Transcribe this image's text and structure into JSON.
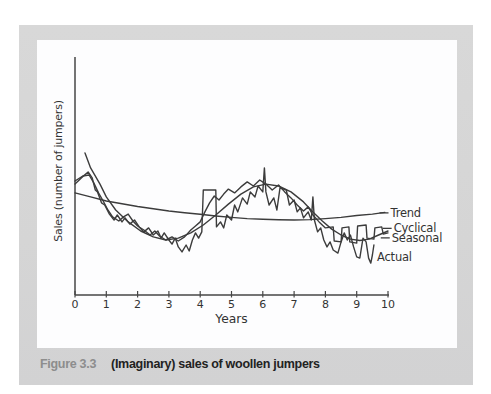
{
  "figure": {
    "label": "Figure 3.3",
    "caption": "(Imaginary) sales of woollen jumpers"
  },
  "colors": {
    "panel_gray": "#d6d6d6",
    "chart_background": "#fdfdfe",
    "ink": "#3c3c3c",
    "axis": "#464646",
    "text": "#333333",
    "figure_label_gray": "#8d8d8d"
  },
  "chart_data": {
    "type": "line",
    "title": "",
    "xlabel": "Years",
    "ylabel": "Sales (number of jumpers)",
    "xlim": [
      0,
      10
    ],
    "ylim": [
      0,
      100
    ],
    "x_ticks": [
      0,
      1,
      2,
      3,
      4,
      5,
      6,
      7,
      8,
      9,
      10
    ],
    "y_ticks": [],
    "grid": false,
    "legend_position": "right-annotations",
    "series": [
      {
        "name": "Trend",
        "label_at": [
          10.08,
          34.5
        ],
        "label_leader": true,
        "points": [
          [
            0,
            42.9
          ],
          [
            0.5,
            41.2
          ],
          [
            1,
            39.5
          ],
          [
            1.5,
            38.3
          ],
          [
            2,
            37.2
          ],
          [
            2.5,
            36.2
          ],
          [
            3,
            35.3
          ],
          [
            3.5,
            34.6
          ],
          [
            4,
            33.9
          ],
          [
            4.5,
            33.2
          ],
          [
            5,
            32.6
          ],
          [
            5.5,
            32.1
          ],
          [
            6,
            31.8
          ],
          [
            6.5,
            31.6
          ],
          [
            7,
            31.5
          ],
          [
            7.5,
            31.7
          ],
          [
            8,
            32.1
          ],
          [
            8.5,
            32.6
          ],
          [
            9,
            33.4
          ],
          [
            9.5,
            34.0
          ],
          [
            9.9,
            34.7
          ]
        ]
      },
      {
        "name": "Cyclical",
        "label_at": [
          10.18,
          28.0
        ],
        "label_leader": true,
        "points": [
          [
            0.32,
            59.7
          ],
          [
            0.5,
            53.4
          ],
          [
            0.8,
            46.6
          ],
          [
            1,
            41.2
          ],
          [
            1.3,
            35.7
          ],
          [
            1.7,
            30.7
          ],
          [
            2.1,
            26.9
          ],
          [
            2.5,
            24.4
          ],
          [
            2.9,
            23.1
          ],
          [
            3.3,
            23.9
          ],
          [
            3.7,
            26.1
          ],
          [
            4.1,
            29.4
          ],
          [
            4.5,
            33.6
          ],
          [
            4.9,
            38.2
          ],
          [
            5.3,
            42.4
          ],
          [
            5.7,
            45.4
          ],
          [
            6.1,
            46.6
          ],
          [
            6.5,
            45.8
          ],
          [
            6.9,
            43.3
          ],
          [
            7.3,
            39.1
          ],
          [
            7.6,
            34.9
          ],
          [
            7.9,
            31.1
          ],
          [
            8.2,
            27.7
          ],
          [
            8.5,
            25.2
          ],
          [
            8.8,
            23.5
          ],
          [
            9.1,
            22.9
          ],
          [
            9.4,
            23.5
          ],
          [
            9.7,
            25.2
          ],
          [
            10,
            26.9
          ]
        ]
      },
      {
        "name": "Seasonal",
        "label_at": [
          10.12,
          24.0
        ],
        "label_leader": true,
        "points": [
          [
            0,
            47.9
          ],
          [
            0.25,
            50
          ],
          [
            0.45,
            50.4
          ],
          [
            0.6,
            47.1
          ],
          [
            0.75,
            42.9
          ],
          [
            0.9,
            39.5
          ],
          [
            1.05,
            35.7
          ],
          [
            1.2,
            32.8
          ],
          [
            1.4,
            31.1
          ],
          [
            1.55,
            32.8
          ],
          [
            1.7,
            34
          ],
          [
            1.85,
            31.1
          ],
          [
            2,
            29
          ],
          [
            2.2,
            27.3
          ],
          [
            2.4,
            25.2
          ],
          [
            2.55,
            26.9
          ],
          [
            2.7,
            24.8
          ],
          [
            2.9,
            23.1
          ],
          [
            3.1,
            24.4
          ],
          [
            3.3,
            22.7
          ],
          [
            3.5,
            24.4
          ],
          [
            3.7,
            27.3
          ],
          [
            3.85,
            29
          ],
          [
            4,
            30.7
          ],
          [
            4.15,
            34.9
          ],
          [
            4.3,
            38.7
          ],
          [
            4.45,
            41.6
          ],
          [
            4.6,
            39.9
          ],
          [
            4.75,
            42.4
          ],
          [
            4.9,
            44.5
          ],
          [
            5.1,
            42.9
          ],
          [
            5.3,
            45.4
          ],
          [
            5.5,
            47.5
          ],
          [
            5.7,
            45.8
          ],
          [
            5.9,
            48.3
          ],
          [
            6.1,
            46.6
          ],
          [
            6.3,
            44.1
          ],
          [
            6.5,
            46.2
          ],
          [
            6.7,
            43.3
          ],
          [
            6.9,
            40.8
          ],
          [
            7.1,
            37.8
          ],
          [
            7.3,
            35.3
          ],
          [
            7.45,
            37
          ],
          [
            7.6,
            33.6
          ],
          [
            7.8,
            30.7
          ],
          [
            8,
            28.2
          ],
          [
            8.25,
            28.6
          ],
          [
            8.28,
            22.7
          ],
          [
            8.5,
            22.3
          ],
          [
            8.53,
            28.2
          ],
          [
            8.75,
            28.6
          ],
          [
            8.78,
            22.3
          ],
          [
            9,
            21.8
          ],
          [
            9.03,
            29
          ],
          [
            9.3,
            29.4
          ],
          [
            9.33,
            23.9
          ],
          [
            9.55,
            23.5
          ],
          [
            9.58,
            28.2
          ],
          [
            9.8,
            28.6
          ],
          [
            9.85,
            25.6
          ],
          [
            10,
            26.1
          ]
        ]
      },
      {
        "name": "Actual",
        "label_at": [
          9.65,
          15.8
        ],
        "label_leader": false,
        "points": [
          [
            0,
            46.6
          ],
          [
            0.2,
            49.2
          ],
          [
            0.42,
            51.7
          ],
          [
            0.55,
            49.2
          ],
          [
            0.65,
            44.1
          ],
          [
            0.72,
            43.3
          ],
          [
            0.85,
            38.7
          ],
          [
            0.95,
            37.8
          ],
          [
            1.1,
            34
          ],
          [
            1.25,
            31.5
          ],
          [
            1.35,
            33.6
          ],
          [
            1.5,
            30.7
          ],
          [
            1.6,
            32.4
          ],
          [
            1.75,
            29.8
          ],
          [
            1.9,
            31.5
          ],
          [
            2.05,
            28.6
          ],
          [
            2.2,
            26.5
          ],
          [
            2.35,
            28.2
          ],
          [
            2.5,
            25.2
          ],
          [
            2.65,
            26.9
          ],
          [
            2.75,
            23.9
          ],
          [
            2.85,
            26.1
          ],
          [
            3,
            23.1
          ],
          [
            3.1,
            21.4
          ],
          [
            3.2,
            23.9
          ],
          [
            3.3,
            20.2
          ],
          [
            3.42,
            18.1
          ],
          [
            3.55,
            21
          ],
          [
            3.65,
            18.5
          ],
          [
            3.75,
            23.1
          ],
          [
            3.85,
            26.1
          ],
          [
            3.95,
            23.9
          ],
          [
            4.05,
            26.5
          ],
          [
            4.1,
            44.1
          ],
          [
            4.5,
            44.1
          ],
          [
            4.52,
            28.6
          ],
          [
            4.65,
            30.7
          ],
          [
            4.75,
            28.2
          ],
          [
            4.85,
            33.6
          ],
          [
            5,
            31.5
          ],
          [
            5.1,
            37.8
          ],
          [
            5.2,
            34.9
          ],
          [
            5.35,
            40.8
          ],
          [
            5.5,
            38.2
          ],
          [
            5.6,
            43.3
          ],
          [
            5.75,
            41.2
          ],
          [
            5.85,
            45.8
          ],
          [
            6,
            43.3
          ],
          [
            6.05,
            53.4
          ],
          [
            6.1,
            43.3
          ],
          [
            6.2,
            37.8
          ],
          [
            6.35,
            40.8
          ],
          [
            6.45,
            35.7
          ],
          [
            6.55,
            45
          ],
          [
            6.75,
            44.1
          ],
          [
            6.85,
            37.8
          ],
          [
            7,
            39.9
          ],
          [
            7.1,
            34.9
          ],
          [
            7.2,
            36.6
          ],
          [
            7.3,
            32.4
          ],
          [
            7.45,
            34.9
          ],
          [
            7.55,
            31.5
          ],
          [
            7.6,
            41.2
          ],
          [
            7.65,
            31.5
          ],
          [
            7.75,
            26.5
          ],
          [
            7.85,
            28.2
          ],
          [
            7.95,
            23.1
          ],
          [
            8.05,
            20.2
          ],
          [
            8.15,
            22.3
          ],
          [
            8.25,
            18.9
          ],
          [
            8.4,
            17.6
          ],
          [
            8.5,
            22.3
          ],
          [
            8.6,
            26.1
          ],
          [
            8.7,
            23.1
          ],
          [
            8.8,
            25.2
          ],
          [
            8.9,
            20.2
          ],
          [
            9,
            16
          ],
          [
            9.1,
            15.5
          ],
          [
            9.2,
            23.9
          ],
          [
            9.3,
            22.3
          ],
          [
            9.38,
            15.5
          ],
          [
            9.45,
            13.4
          ],
          [
            9.5,
            16.8
          ],
          [
            9.55,
            21
          ]
        ]
      }
    ]
  }
}
